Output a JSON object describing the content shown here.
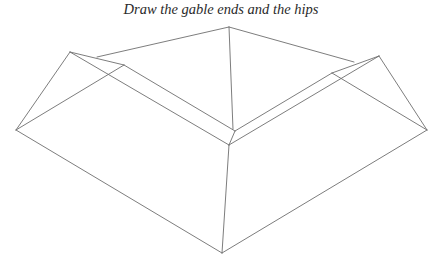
{
  "title": "Draw the gable ends and the hips",
  "diagram": {
    "type": "roof-line-drawing",
    "stroke_color": "#6e6e6e",
    "points": {
      "top_apex": [
        229,
        27
      ],
      "left_gable_apex": [
        70,
        52
      ],
      "left_gable_inner": [
        124,
        65
      ],
      "left_tip": [
        16,
        130
      ],
      "right_gable_apex": [
        379,
        56
      ],
      "right_gable_inner": [
        332,
        73
      ],
      "right_tip": [
        427,
        130
      ],
      "valley_upper": [
        235,
        131
      ],
      "valley_lower": [
        229,
        145
      ],
      "bottom": [
        222,
        253
      ]
    },
    "segments": [
      {
        "name": "top-ridge-left",
        "from": [
          97,
          57
        ],
        "to": [
          229,
          27
        ]
      },
      {
        "name": "top-ridge-right",
        "from": [
          229,
          27
        ],
        "to": [
          354,
          62
        ]
      },
      {
        "name": "center-hip",
        "from": [
          229,
          27
        ],
        "to": [
          233,
          129
        ]
      },
      {
        "name": "left-gable-top",
        "from": [
          70,
          52
        ],
        "to": [
          124,
          65
        ]
      },
      {
        "name": "left-gable-left",
        "from": [
          70,
          52
        ],
        "to": [
          16,
          130
        ]
      },
      {
        "name": "left-gable-diagonal",
        "from": [
          124,
          65
        ],
        "to": [
          16,
          130
        ]
      },
      {
        "name": "left-ridge-upper",
        "from": [
          124,
          65
        ],
        "to": [
          235,
          131
        ]
      },
      {
        "name": "left-ridge-lower",
        "from": [
          70,
          52
        ],
        "to": [
          229,
          145
        ]
      },
      {
        "name": "right-gable-top",
        "from": [
          332,
          73
        ],
        "to": [
          379,
          56
        ]
      },
      {
        "name": "right-gable-right",
        "from": [
          379,
          56
        ],
        "to": [
          427,
          130
        ]
      },
      {
        "name": "right-gable-diagonal",
        "from": [
          332,
          73
        ],
        "to": [
          427,
          130
        ]
      },
      {
        "name": "right-ridge-upper",
        "from": [
          235,
          131
        ],
        "to": [
          332,
          73
        ]
      },
      {
        "name": "right-ridge-lower",
        "from": [
          229,
          145
        ],
        "to": [
          379,
          56
        ]
      },
      {
        "name": "valley-join",
        "from": [
          235,
          131
        ],
        "to": [
          229,
          145
        ]
      },
      {
        "name": "front-hip",
        "from": [
          229,
          145
        ],
        "to": [
          222,
          253
        ]
      },
      {
        "name": "left-eave",
        "from": [
          16,
          130
        ],
        "to": [
          222,
          253
        ]
      },
      {
        "name": "right-eave",
        "from": [
          427,
          130
        ],
        "to": [
          222,
          253
        ]
      }
    ]
  }
}
